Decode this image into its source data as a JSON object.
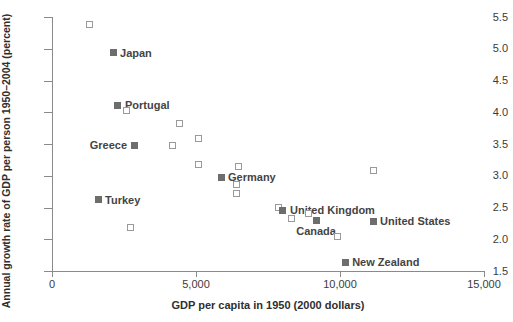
{
  "chart_data": {
    "type": "scatter",
    "title": "",
    "xlabel": "GDP per capita in 1950 (2000 dollars)",
    "ylabel": "Annual growth rate of GDP per person 1950–2004  (percent)",
    "xlim": [
      0,
      15000
    ],
    "ylim": [
      1.5,
      5.5
    ],
    "grid": false,
    "legend": "none",
    "xticks": [
      {
        "value": 0,
        "label": "0"
      },
      {
        "value": 5000,
        "label": "5,000"
      },
      {
        "value": 10000,
        "label": "10,000"
      },
      {
        "value": 15000,
        "label": "15,000"
      }
    ],
    "yticks": [
      {
        "value": 5.5,
        "label": "5.5"
      },
      {
        "value": 5.0,
        "label": "5.0"
      },
      {
        "value": 4.5,
        "label": "4.5"
      },
      {
        "value": 4.0,
        "label": "4.0"
      },
      {
        "value": 3.5,
        "label": "3.5"
      },
      {
        "value": 3.0,
        "label": "3.0"
      },
      {
        "value": 2.5,
        "label": "2.5"
      },
      {
        "value": 2.0,
        "label": "2.0"
      },
      {
        "value": 1.5,
        "label": "1.5"
      }
    ],
    "marker_styles": {
      "labeled": "filled-square",
      "unlabeled": "open-square",
      "filled_color": "#6d6d6d",
      "open_color": "#9a9a9a"
    },
    "points": [
      {
        "x": 1290,
        "y": 5.38,
        "label": "",
        "marker": "open"
      },
      {
        "x": 2120,
        "y": 4.94,
        "label": "Japan",
        "marker": "filled",
        "label_pos": "right"
      },
      {
        "x": 2290,
        "y": 4.11,
        "label": "Portugal",
        "marker": "filled",
        "label_pos": "right"
      },
      {
        "x": 2570,
        "y": 4.03,
        "label": "",
        "marker": "open"
      },
      {
        "x": 4410,
        "y": 3.83,
        "label": "",
        "marker": "open"
      },
      {
        "x": 5070,
        "y": 3.58,
        "label": "",
        "marker": "open"
      },
      {
        "x": 2850,
        "y": 3.48,
        "label": "Greece",
        "marker": "filled",
        "label_pos": "left"
      },
      {
        "x": 4170,
        "y": 3.47,
        "label": "",
        "marker": "open"
      },
      {
        "x": 5070,
        "y": 3.17,
        "label": "",
        "marker": "open"
      },
      {
        "x": 6490,
        "y": 3.14,
        "label": "",
        "marker": "open"
      },
      {
        "x": 5870,
        "y": 2.98,
        "label": "Germany",
        "marker": "filled",
        "label_pos": "right"
      },
      {
        "x": 6390,
        "y": 2.86,
        "label": "",
        "marker": "open"
      },
      {
        "x": 6390,
        "y": 2.72,
        "label": "",
        "marker": "open"
      },
      {
        "x": 1600,
        "y": 2.62,
        "label": "Turkey",
        "marker": "filled",
        "label_pos": "right"
      },
      {
        "x": 11180,
        "y": 3.09,
        "label": "",
        "marker": "open"
      },
      {
        "x": 7850,
        "y": 2.5,
        "label": "",
        "marker": "open"
      },
      {
        "x": 8020,
        "y": 2.46,
        "label": "United Kingdom",
        "marker": "filled",
        "label_pos": "right"
      },
      {
        "x": 8890,
        "y": 2.4,
        "label": "",
        "marker": "open"
      },
      {
        "x": 8330,
        "y": 2.33,
        "label": "",
        "marker": "open"
      },
      {
        "x": 9170,
        "y": 2.3,
        "label": "Canada",
        "marker": "filled",
        "label_pos": "below"
      },
      {
        "x": 11150,
        "y": 2.28,
        "label": "United States",
        "marker": "filled",
        "label_pos": "right"
      },
      {
        "x": 2740,
        "y": 2.19,
        "label": "",
        "marker": "open"
      },
      {
        "x": 9930,
        "y": 2.04,
        "label": "",
        "marker": "open"
      },
      {
        "x": 10180,
        "y": 1.64,
        "label": "New Zealand",
        "marker": "filled",
        "label_pos": "right"
      }
    ]
  }
}
